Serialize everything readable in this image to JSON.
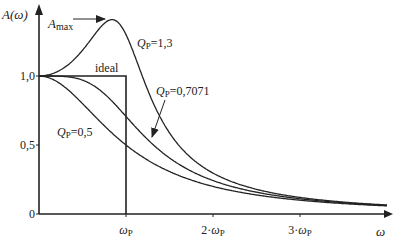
{
  "chart_data": {
    "type": "line",
    "title": "",
    "xlabel": "ω",
    "ylabel": "A(ω)",
    "ylim": [
      0,
      1.45
    ],
    "xlim": [
      0,
      4
    ],
    "grid": false,
    "x_ticks": [
      {
        "value": 1,
        "label": "ωP"
      },
      {
        "value": 2,
        "label": "2·ωP"
      },
      {
        "value": 3,
        "label": "3·ωP"
      }
    ],
    "y_ticks": [
      {
        "value": 0,
        "label": "0"
      },
      {
        "value": 0.5,
        "label": "0,5"
      },
      {
        "value": 1.0,
        "label": "1,0"
      }
    ],
    "series": [
      {
        "name": "QP=1,3",
        "Q": 1.3,
        "label_q": "Q",
        "label_sub": "P",
        "label_val": "=1,3"
      },
      {
        "name": "QP=0,7071",
        "Q": 0.7071,
        "label_q": "Q",
        "label_sub": "P",
        "label_val": "=0,7071"
      },
      {
        "name": "QP=0,5",
        "Q": 0.5,
        "label_q": "Q",
        "label_sub": "P",
        "label_val": "=0,5"
      },
      {
        "name": "ideal",
        "type": "step",
        "cutoff": 1,
        "level": 1
      }
    ],
    "annotations": {
      "amax": {
        "main": "A",
        "sub": "max"
      },
      "ideal": "ideal",
      "y_axis_label": "A(ω)",
      "x_axis_label": "ω"
    }
  }
}
